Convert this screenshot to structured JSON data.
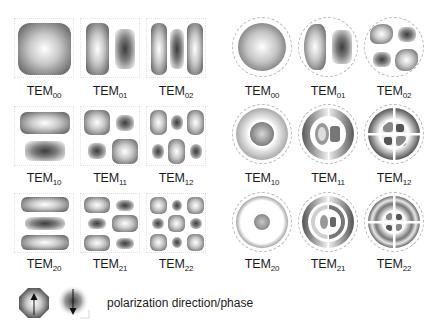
{
  "figure": {
    "left_panel": {
      "shape": "square-aperture",
      "modes": [
        {
          "label": "TEM",
          "sub": "00"
        },
        {
          "label": "TEM",
          "sub": "01"
        },
        {
          "label": "TEM",
          "sub": "02"
        },
        {
          "label": "TEM",
          "sub": "10"
        },
        {
          "label": "TEM",
          "sub": "11"
        },
        {
          "label": "TEM",
          "sub": "12"
        },
        {
          "label": "TEM",
          "sub": "20"
        },
        {
          "label": "TEM",
          "sub": "21"
        },
        {
          "label": "TEM",
          "sub": "22"
        }
      ]
    },
    "right_panel": {
      "shape": "circular-aperture",
      "modes": [
        {
          "label": "TEM",
          "sub": "00"
        },
        {
          "label": "TEM",
          "sub": "01"
        },
        {
          "label": "TEM",
          "sub": "02"
        },
        {
          "label": "TEM",
          "sub": "10"
        },
        {
          "label": "TEM",
          "sub": "11"
        },
        {
          "label": "TEM",
          "sub": "12"
        },
        {
          "label": "TEM",
          "sub": "20"
        },
        {
          "label": "TEM",
          "sub": "21"
        },
        {
          "label": "TEM",
          "sub": "22"
        }
      ]
    },
    "legend": {
      "icons": [
        "polarization-up-icon",
        "polarization-down-icon"
      ],
      "text": "polarization direction/phase"
    },
    "colors": {
      "background": "#ffffff",
      "lobe_dark": "#555555",
      "lobe_light": "#ffffff",
      "text": "#1a1a1a"
    }
  }
}
